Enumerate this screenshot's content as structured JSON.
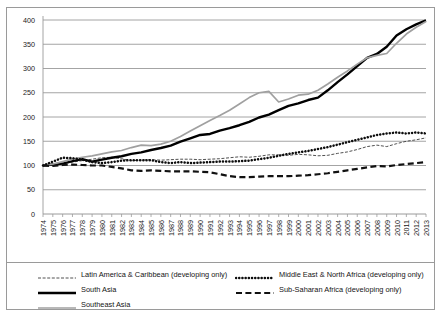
{
  "chart_data": {
    "type": "line",
    "title": "",
    "subtitle": "",
    "xlabel": "",
    "ylabel": "",
    "ylim": [
      0,
      400
    ],
    "yticks": [
      0,
      50,
      100,
      150,
      200,
      250,
      300,
      350,
      400
    ],
    "grid": true,
    "legend_position": "bottom",
    "x": [
      1974,
      1975,
      1976,
      1977,
      1978,
      1979,
      1980,
      1981,
      1982,
      1983,
      1984,
      1985,
      1986,
      1987,
      1988,
      1989,
      1990,
      1991,
      1992,
      1993,
      1994,
      1995,
      1996,
      1997,
      1998,
      1999,
      2000,
      2001,
      2002,
      2003,
      2004,
      2005,
      2006,
      2007,
      2008,
      2009,
      2010,
      2011,
      2012,
      2013
    ],
    "xticklabels": [
      "1974",
      "1975",
      "1976",
      "1977",
      "1978",
      "1979",
      "1980",
      "1981",
      "1982",
      "1983",
      "1984",
      "1985",
      "1986",
      "1987",
      "1988",
      "1989",
      "1990",
      "1991",
      "1992",
      "1993",
      "1994",
      "1995",
      "1996",
      "1997",
      "1998",
      "1999",
      "2000",
      "2001",
      "2002",
      "2003",
      "2004",
      "2005",
      "2006",
      "2007",
      "2008",
      "2009",
      "2010",
      "2011",
      "2012",
      "2013"
    ],
    "series": [
      {
        "name": "Latin America & Caribbean (developing only)",
        "style": "thin-dashed",
        "color": "#3c3c3c",
        "values": [
          100,
          101,
          104,
          107,
          110,
          113,
          116,
          117,
          114,
          110,
          111,
          112,
          111,
          112,
          113,
          113,
          112,
          113,
          114,
          116,
          118,
          117,
          119,
          122,
          122,
          121,
          123,
          122,
          120,
          121,
          125,
          128,
          133,
          139,
          142,
          139,
          145,
          150,
          153,
          157
        ]
      },
      {
        "name": "South Asia",
        "style": "thick-solid",
        "color": "#000000",
        "values": [
          100,
          102,
          104,
          109,
          113,
          108,
          112,
          116,
          119,
          124,
          127,
          132,
          136,
          141,
          149,
          156,
          163,
          165,
          172,
          177,
          183,
          190,
          199,
          205,
          214,
          223,
          228,
          235,
          240,
          255,
          272,
          288,
          305,
          322,
          330,
          345,
          368,
          381,
          391,
          399
        ]
      },
      {
        "name": "Southeast Asia",
        "style": "medium-solid-gray",
        "color": "#a0a0a0",
        "values": [
          100,
          103,
          108,
          113,
          117,
          120,
          124,
          128,
          131,
          137,
          142,
          141,
          144,
          150,
          160,
          171,
          182,
          193,
          203,
          214,
          227,
          240,
          250,
          253,
          231,
          237,
          245,
          247,
          255,
          268,
          282,
          295,
          309,
          322,
          327,
          331,
          352,
          371,
          385,
          397
        ]
      },
      {
        "name": "Middle East & North Africa (developing only)",
        "style": "thick-dotted",
        "color": "#0d0d0d",
        "values": [
          100,
          108,
          116,
          115,
          112,
          107,
          105,
          107,
          110,
          111,
          111,
          111,
          107,
          105,
          107,
          105,
          106,
          107,
          108,
          108,
          109,
          110,
          113,
          116,
          120,
          124,
          127,
          130,
          134,
          138,
          143,
          148,
          153,
          158,
          163,
          166,
          168,
          166,
          168,
          166
        ]
      },
      {
        "name": "Sub-Saharan Africa (developing only)",
        "style": "thick-dashed",
        "color": "#111111",
        "values": [
          100,
          99,
          101,
          102,
          101,
          100,
          100,
          97,
          94,
          90,
          89,
          90,
          89,
          88,
          88,
          88,
          87,
          86,
          82,
          78,
          76,
          76,
          77,
          78,
          78,
          78,
          79,
          80,
          82,
          84,
          87,
          90,
          93,
          96,
          99,
          98,
          101,
          103,
          105,
          107
        ]
      }
    ]
  },
  "legend": {
    "items": [
      {
        "label": "Latin America & Caribbean (developing only)",
        "key": "thin-dashed"
      },
      {
        "label": "South Asia",
        "key": "thick-solid"
      },
      {
        "label": "Southeast Asia",
        "key": "medium-solid-gray"
      },
      {
        "label": "Middle East & North Africa (developing only)",
        "key": "thick-dotted"
      },
      {
        "label": "Sub-Saharan Africa (developing only)",
        "key": "thick-dashed"
      }
    ]
  },
  "colors": {
    "grid": "#9a9a9a",
    "frame": "#9a9a9a",
    "text": "#1a1a1a",
    "south_asia": "#000000",
    "southeast_asia": "#a0a0a0"
  }
}
